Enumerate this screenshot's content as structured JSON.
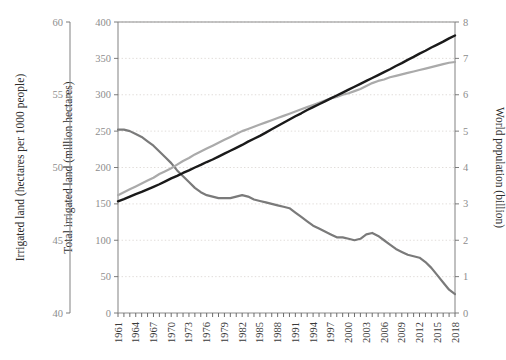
{
  "chart_data": {
    "type": "line",
    "title": "",
    "xlabel": "",
    "grid": "horizontal-dotted",
    "legend": "none",
    "x": [
      1961,
      1962,
      1963,
      1964,
      1965,
      1966,
      1967,
      1968,
      1969,
      1970,
      1971,
      1972,
      1973,
      1974,
      1975,
      1976,
      1977,
      1978,
      1979,
      1980,
      1981,
      1982,
      1983,
      1984,
      1985,
      1986,
      1987,
      1988,
      1989,
      1990,
      1991,
      1992,
      1993,
      1994,
      1995,
      1996,
      1997,
      1998,
      1999,
      2000,
      2001,
      2002,
      2003,
      2004,
      2005,
      2006,
      2007,
      2008,
      2009,
      2010,
      2011,
      2012,
      2013,
      2014,
      2015,
      2016,
      2017,
      2018
    ],
    "xtick_labels": [
      "1961",
      "1964",
      "1967",
      "1970",
      "1973",
      "1976",
      "1979",
      "1982",
      "1985",
      "1988",
      "1991",
      "1994",
      "1997",
      "2000",
      "2003",
      "2006",
      "2009",
      "2012",
      "2015",
      "2018"
    ],
    "axes": {
      "left_outer": {
        "label": "Irrigated land (hectares per 1000 people)",
        "ticks": [
          40,
          45,
          50,
          55,
          60
        ],
        "min": 40,
        "max": 60
      },
      "left_inner": {
        "label": "Total irrigated land (million hectares)",
        "ticks": [
          0,
          50,
          100,
          150,
          200,
          250,
          300,
          350,
          400
        ],
        "min": 0,
        "max": 400
      },
      "right": {
        "label": "World population (billion)",
        "ticks": [
          0,
          1,
          2,
          3,
          4,
          5,
          6,
          7,
          8
        ],
        "min": 0,
        "max": 8
      }
    },
    "series": [
      {
        "name": "Irrigated land (hectares per 1000 people)",
        "axis": "left_outer",
        "color": "#7a7a7a",
        "width": 2.2,
        "values": [
          52.6,
          52.6,
          52.5,
          52.3,
          52.1,
          51.8,
          51.5,
          51.1,
          50.7,
          50.3,
          49.8,
          49.4,
          49.0,
          48.6,
          48.3,
          48.1,
          48.0,
          47.9,
          47.9,
          47.9,
          48.0,
          48.1,
          48.0,
          47.8,
          47.7,
          47.6,
          47.5,
          47.4,
          47.3,
          47.2,
          46.9,
          46.6,
          46.3,
          46.0,
          45.8,
          45.6,
          45.4,
          45.2,
          45.2,
          45.1,
          45.0,
          45.1,
          45.4,
          45.5,
          45.3,
          45.0,
          44.7,
          44.4,
          44.2,
          44.0,
          43.9,
          43.8,
          43.5,
          43.1,
          42.6,
          42.1,
          41.6,
          41.3
        ]
      },
      {
        "name": "Total irrigated land (million hectares)",
        "axis": "left_inner",
        "color": "#aaaaaa",
        "width": 2.2,
        "values": [
          162,
          166,
          170,
          174,
          178,
          182,
          186,
          191,
          195,
          199,
          204,
          209,
          213,
          218,
          222,
          226,
          230,
          234,
          238,
          242,
          246,
          250,
          253,
          256,
          259,
          262,
          265,
          268,
          271,
          274,
          277,
          280,
          283,
          286,
          289,
          292,
          295,
          297,
          300,
          302,
          305,
          308,
          312,
          316,
          319,
          321,
          324,
          326,
          328,
          330,
          332,
          334,
          336,
          338,
          340,
          342,
          344,
          345
        ]
      },
      {
        "name": "World population (billion)",
        "axis": "right",
        "color": "#1a1a1a",
        "width": 2.4,
        "values": [
          3.07,
          3.13,
          3.2,
          3.27,
          3.33,
          3.4,
          3.47,
          3.54,
          3.62,
          3.7,
          3.77,
          3.85,
          3.92,
          4.0,
          4.07,
          4.15,
          4.22,
          4.3,
          4.38,
          4.46,
          4.54,
          4.62,
          4.71,
          4.79,
          4.87,
          4.96,
          5.05,
          5.14,
          5.23,
          5.32,
          5.41,
          5.49,
          5.58,
          5.66,
          5.74,
          5.82,
          5.9,
          5.98,
          6.06,
          6.14,
          6.22,
          6.3,
          6.38,
          6.46,
          6.54,
          6.62,
          6.7,
          6.79,
          6.87,
          6.96,
          7.04,
          7.13,
          7.21,
          7.3,
          7.38,
          7.46,
          7.55,
          7.63
        ]
      }
    ]
  },
  "colors": {
    "axis": "#6e6e6e",
    "grid": "#d9d4d0",
    "tick_text": "#8d8d8d",
    "title_text": "#2b2b2b",
    "plot_border": "#8c8c8c"
  }
}
